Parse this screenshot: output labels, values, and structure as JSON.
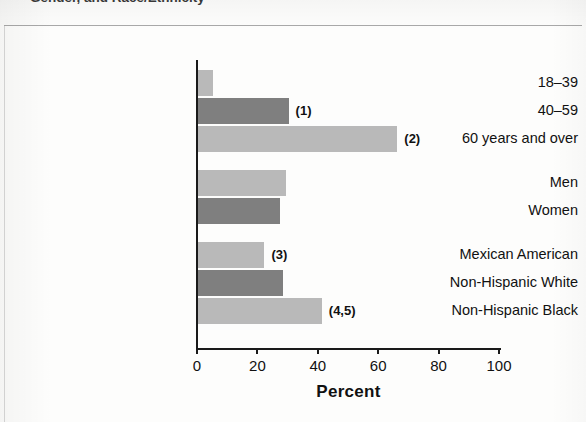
{
  "caption": {
    "clipped_text": "Gender, and Race/Ethnicity"
  },
  "chart_data": {
    "type": "bar",
    "orientation": "horizontal",
    "title": "",
    "xlabel": "Percent",
    "ylabel": "",
    "xlim": [
      0,
      100
    ],
    "xticks": [
      0,
      20,
      40,
      60,
      80,
      100
    ],
    "grid": false,
    "legend": null,
    "groups": [
      {
        "name": "Age",
        "items": [
          {
            "label": "18–39",
            "value": 5,
            "shade": "light",
            "note": ""
          },
          {
            "label": "40–59",
            "value": 30,
            "shade": "dark",
            "note": "(1)"
          },
          {
            "label": "60 years and over",
            "value": 66,
            "shade": "light",
            "note": "(2)"
          }
        ]
      },
      {
        "name": "Gender",
        "items": [
          {
            "label": "Men",
            "value": 29,
            "shade": "light",
            "note": ""
          },
          {
            "label": "Women",
            "value": 27,
            "shade": "dark",
            "note": ""
          }
        ]
      },
      {
        "name": "Race/Ethnicity",
        "items": [
          {
            "label": "Mexican American",
            "value": 22,
            "shade": "light",
            "note": "(3)"
          },
          {
            "label": "Non-Hispanic White",
            "value": 28,
            "shade": "dark",
            "note": ""
          },
          {
            "label": "Non-Hispanic Black",
            "value": 41,
            "shade": "light",
            "note": "(4,5)"
          }
        ]
      }
    ],
    "categories": [
      "18–39",
      "40–59",
      "60 years and over",
      "Men",
      "Women",
      "Mexican American",
      "Non-Hispanic White",
      "Non-Hispanic Black"
    ],
    "values": [
      5,
      30,
      66,
      29,
      27,
      22,
      28,
      41
    ],
    "annotations": [
      "",
      "(1)",
      "(2)",
      "",
      "",
      "(3)",
      "",
      "(4,5)"
    ]
  },
  "colors": {
    "bar_light": "#b9b9b9",
    "bar_dark": "#7f7f7f",
    "axis": "#1a1a1a",
    "text": "#111111",
    "page": "#fdfdfc"
  }
}
